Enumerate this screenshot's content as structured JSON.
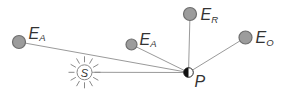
{
  "figure": {
    "background": "#ffffff",
    "colors": {
      "line": "#9a9a9a",
      "node_fill": "#9c9c9c",
      "node_stroke": "#6e6e6e",
      "sun_stroke": "#8a8a8a",
      "point_fill": "#111111",
      "point_stroke": "#222222",
      "label": "#333333"
    },
    "nodes": [
      {
        "id": "ea-left",
        "symbol": "E",
        "subscript": "A"
      },
      {
        "id": "ea-middle",
        "symbol": "E",
        "subscript": "A"
      },
      {
        "id": "er-top",
        "symbol": "E",
        "subscript": "R"
      },
      {
        "id": "eo-right",
        "symbol": "E",
        "subscript": "O"
      }
    ],
    "sun": {
      "label": "S"
    },
    "point": {
      "label": "P"
    }
  }
}
